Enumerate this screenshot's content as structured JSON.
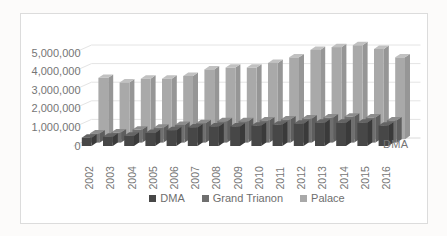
{
  "colors": {
    "background": "#ffffff",
    "frame_border": "#dcdcdc",
    "gridline": "#e4e4e4",
    "floor_line": "#dadada",
    "axis_text": "#757575",
    "legend_text": "#6e6e6e"
  },
  "chart_data": {
    "type": "bar",
    "style": "3d-clustered-column",
    "title": "",
    "xlabel": "",
    "ylabel": "",
    "series_axis_label": "DMA",
    "grid": true,
    "legend_position": "bottom",
    "ylim": [
      0,
      5500000
    ],
    "yticks": [
      {
        "value": 0,
        "label": "0"
      },
      {
        "value": 1000000,
        "label": "1,000,000"
      },
      {
        "value": 2000000,
        "label": "2,000,000"
      },
      {
        "value": 3000000,
        "label": "3,000,000"
      },
      {
        "value": 4000000,
        "label": "4,000,000"
      },
      {
        "value": 5000000,
        "label": "5,000,000"
      }
    ],
    "categories": [
      "2002",
      "2003",
      "2004",
      "2005",
      "2006",
      "2007",
      "2008",
      "2009",
      "2010",
      "2011",
      "2012",
      "2013",
      "2014",
      "2015",
      "2016"
    ],
    "series": [
      {
        "name": "DMA",
        "color": "#474747",
        "color_top": "#646464",
        "color_side": "#3a3a3a",
        "values": [
          450000,
          500000,
          550000,
          700000,
          850000,
          1000000,
          1050000,
          1050000,
          1100000,
          1150000,
          1200000,
          1250000,
          1250000,
          1250000,
          1100000
        ]
      },
      {
        "name": "Grand Trianon",
        "color": "#6f6f6f",
        "color_top": "#8c8c8c",
        "color_side": "#5e5e5e",
        "values": [
          500000,
          550000,
          700000,
          800000,
          950000,
          1050000,
          1150000,
          1150000,
          1200000,
          1250000,
          1300000,
          1350000,
          1400000,
          1350000,
          1200000
        ]
      },
      {
        "name": "Palace",
        "color": "#a9a9a9",
        "color_top": "#c1c1c1",
        "color_side": "#969696",
        "values": [
          3300000,
          3050000,
          3250000,
          3250000,
          3400000,
          3750000,
          3850000,
          3850000,
          4100000,
          4400000,
          4800000,
          4950000,
          5050000,
          4850000,
          4400000
        ]
      }
    ]
  }
}
